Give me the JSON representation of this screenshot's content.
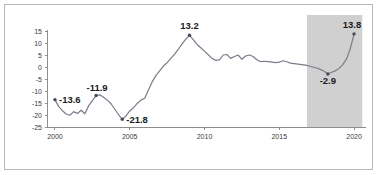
{
  "chart_data": {
    "type": "line",
    "title": "",
    "subtitle": "",
    "xlabel": "",
    "ylabel": "",
    "xlim": [
      1999.5,
      2020.8
    ],
    "ylim": [
      -25,
      15
    ],
    "grid": false,
    "legend": "none",
    "y_ticks": [
      15,
      10,
      5,
      0,
      -5,
      -10,
      -15,
      -20,
      -25
    ],
    "y_tick_labels": [
      "15",
      "10",
      "5",
      "0",
      "-5",
      "-10",
      "-15",
      "-20",
      "-25"
    ],
    "x_ticks": [
      2000,
      2005,
      2010,
      2015,
      2020
    ],
    "x_tick_labels": [
      "2000",
      "2005",
      "2010",
      "2015",
      "2020"
    ],
    "series": [
      {
        "name": "value",
        "x": [
          2000.0,
          2000.25,
          2000.5,
          2000.75,
          2001.0,
          2001.25,
          2001.5,
          2001.75,
          2002.0,
          2002.25,
          2002.5,
          2002.75,
          2003.0,
          2003.25,
          2003.5,
          2003.75,
          2004.0,
          2004.25,
          2004.5,
          2004.75,
          2005.0,
          2005.25,
          2005.5,
          2005.75,
          2006.0,
          2006.25,
          2006.5,
          2006.75,
          2007.0,
          2007.25,
          2007.5,
          2007.75,
          2008.0,
          2008.25,
          2008.5,
          2008.75,
          2009.0,
          2009.25,
          2009.5,
          2009.75,
          2010.0,
          2010.25,
          2010.5,
          2010.75,
          2011.0,
          2011.25,
          2011.5,
          2011.75,
          2012.0,
          2012.25,
          2012.5,
          2012.75,
          2013.0,
          2013.25,
          2013.5,
          2013.75,
          2014.0,
          2014.25,
          2014.5,
          2014.75,
          2015.0,
          2015.25,
          2015.5,
          2015.75,
          2016.0,
          2016.25,
          2016.5,
          2016.75,
          2017.0,
          2017.25,
          2017.5,
          2017.75,
          2018.0,
          2018.25,
          2018.5,
          2018.75,
          2019.0,
          2019.25,
          2019.5,
          2019.75,
          2020.0
        ],
        "y": [
          -13.6,
          -16.5,
          -18.2,
          -19.6,
          -20.1,
          -18.6,
          -19.4,
          -18.0,
          -19.5,
          -16.2,
          -14.0,
          -11.9,
          -11.6,
          -12.6,
          -13.8,
          -15.3,
          -17.6,
          -19.8,
          -21.8,
          -20.4,
          -18.3,
          -17.0,
          -15.2,
          -13.8,
          -13.0,
          -9.6,
          -6.2,
          -3.6,
          -1.6,
          0.4,
          1.8,
          3.6,
          5.4,
          7.4,
          9.6,
          11.6,
          13.2,
          11.4,
          9.4,
          8.0,
          6.6,
          5.1,
          3.6,
          2.8,
          3.0,
          5.0,
          5.2,
          3.6,
          4.4,
          5.0,
          3.2,
          4.6,
          5.0,
          4.4,
          3.0,
          2.2,
          2.4,
          2.2,
          2.0,
          1.8,
          2.0,
          2.6,
          2.2,
          1.6,
          1.4,
          1.2,
          1.0,
          0.8,
          0.4,
          0.0,
          -0.4,
          -1.0,
          -1.8,
          -2.9,
          -2.2,
          -1.6,
          -0.6,
          1.0,
          3.4,
          7.6,
          13.8
        ]
      }
    ],
    "annotations": [
      {
        "label": "-13.6",
        "x": 2000.0,
        "y": -13.6,
        "marker": true,
        "align": "start",
        "dx": 4,
        "dy": 3.5
      },
      {
        "label": "-11.9",
        "x": 2002.75,
        "y": -11.9,
        "marker": true,
        "align": "mid",
        "dx": 1,
        "dy": -5
      },
      {
        "label": "-21.8",
        "x": 2004.5,
        "y": -21.8,
        "marker": true,
        "align": "start",
        "dx": 4,
        "dy": 3.5
      },
      {
        "label": "13.2",
        "x": 2009.0,
        "y": 13.2,
        "marker": true,
        "align": "mid",
        "dx": 0,
        "dy": -6
      },
      {
        "label": "-2.9",
        "x": 2018.25,
        "y": -2.9,
        "marker": true,
        "align": "mid",
        "dx": 0,
        "dy": 10
      },
      {
        "label": "13.8",
        "x": 2020.0,
        "y": 13.8,
        "marker": true,
        "align": "mid",
        "dx": -2,
        "dy": -6
      }
    ],
    "shaded_regions": [
      {
        "name": "forecast-band",
        "x_start": 2016.85,
        "x_end": 2020.55,
        "color": "#c9c9c9"
      }
    ],
    "colors": {
      "line": "#7b7b8c",
      "marker": "#4a4a55",
      "axis": "#8d8d8d",
      "shade": "#c9c9c9",
      "frame": "#b8b8b8",
      "label_text": "#1a1a1a",
      "tick_text": "#3a3a3a"
    }
  }
}
